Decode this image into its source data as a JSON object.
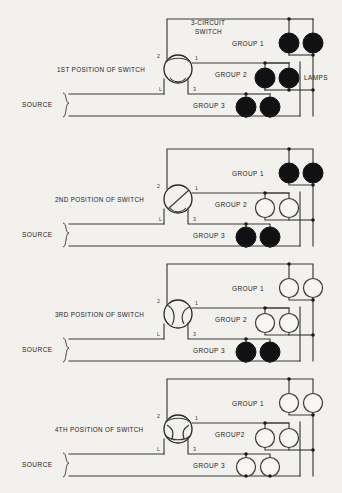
{
  "diagram": {
    "title_block": {
      "switch_label_line1": "3-CIRCUIT",
      "switch_label_line2": "SWITCH",
      "lamps_label": "LAMPS"
    },
    "source_label": "SOURCE",
    "terminal_labels": {
      "t1": "1",
      "t2": "2",
      "t3": "3",
      "tL": "L"
    },
    "panels": [
      {
        "position_label": "1ST POSITION OF SWITCH",
        "source_label": "SOURCE",
        "switch_state": "closed-all",
        "groups": [
          {
            "label": "GROUP 1",
            "lamps": [
              "on",
              "on"
            ]
          },
          {
            "label": "GROUP 2",
            "lamps": [
              "on",
              "on"
            ]
          },
          {
            "label": "GROUP 3",
            "lamps": [
              "on",
              "on"
            ]
          }
        ]
      },
      {
        "position_label": "2ND POSITION OF SWITCH",
        "source_label": "SOURCE",
        "switch_state": "diagonal",
        "groups": [
          {
            "label": "GROUP 1",
            "lamps": [
              "on",
              "on"
            ]
          },
          {
            "label": "GROUP 2",
            "lamps": [
              "off",
              "off"
            ]
          },
          {
            "label": "GROUP 3",
            "lamps": [
              "on",
              "on"
            ]
          }
        ]
      },
      {
        "position_label": "3RD POSITION OF SWITCH",
        "source_label": "SOURCE",
        "switch_state": "s-curve",
        "groups": [
          {
            "label": "GROUP 1",
            "lamps": [
              "off",
              "off"
            ]
          },
          {
            "label": "GROUP 2",
            "lamps": [
              "off",
              "off"
            ]
          },
          {
            "label": "GROUP 3",
            "lamps": [
              "on",
              "on"
            ]
          }
        ]
      },
      {
        "position_label": "4TH POSITION OF SWITCH",
        "source_label": "SOURCE",
        "switch_state": "open-all",
        "groups": [
          {
            "label": "GROUP 1",
            "lamps": [
              "off",
              "off"
            ]
          },
          {
            "label": "GROUP2",
            "lamps": [
              "off",
              "off"
            ]
          },
          {
            "label": "GROUP 3",
            "lamps": [
              "off",
              "off"
            ]
          }
        ]
      }
    ],
    "colors": {
      "background": "#f2f1ed",
      "wire": "#3b3a38",
      "lamp_on": "#111013",
      "lamp_off": "#f7f6f3",
      "text": "#232225"
    }
  }
}
